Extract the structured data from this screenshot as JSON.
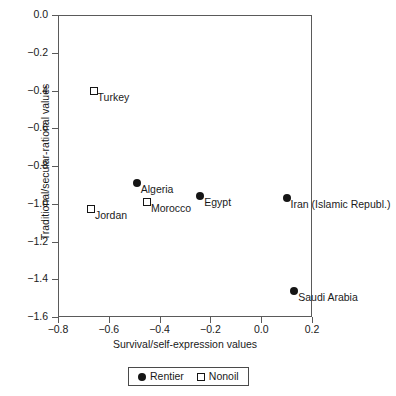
{
  "chart_data": {
    "type": "scatter",
    "title": "",
    "xlabel": "Survival/self-expression values",
    "ylabel": "Traditional/secular-rational values",
    "xlim": [
      -0.8,
      0.2
    ],
    "ylim": [
      -1.6,
      0.0
    ],
    "xticks": [
      "-0.8",
      "-0.6",
      "-0.4",
      "-0.2",
      "0.0",
      "0.2"
    ],
    "xtick_values": [
      -0.8,
      -0.6,
      -0.4,
      -0.2,
      0.0,
      0.2
    ],
    "yticks": [
      "0.0",
      "-0.2",
      "-0.4",
      "-0.6",
      "-0.8",
      "-1.0",
      "-1.2",
      "-1.4",
      "-1.6"
    ],
    "ytick_values": [
      0.0,
      -0.2,
      -0.4,
      -0.6,
      -0.8,
      -1.0,
      -1.2,
      -1.4,
      -1.6
    ],
    "grid": false,
    "legend_position": "bottom-center",
    "series": [
      {
        "name": "Rentier",
        "marker": "filled-circle",
        "color": "#151515",
        "points": [
          {
            "label": "Algeria",
            "x": -0.49,
            "y": -0.89,
            "label_pos": "right"
          },
          {
            "label": "Egypt",
            "x": -0.24,
            "y": -0.96,
            "label_pos": "right"
          },
          {
            "label": "Iran (Islamic Republ.)",
            "x": 0.1,
            "y": -0.97,
            "label_pos": "right"
          },
          {
            "label": "Saudi Arabia",
            "x": 0.13,
            "y": -1.46,
            "label_pos": "right"
          }
        ]
      },
      {
        "name": "Nonoil",
        "marker": "open-square",
        "color": "#151515",
        "points": [
          {
            "label": "Turkey",
            "x": -0.66,
            "y": -0.4,
            "label_pos": "right"
          },
          {
            "label": "Jordan",
            "x": -0.67,
            "y": -1.03,
            "label_pos": "right"
          },
          {
            "label": "Morocco",
            "x": -0.45,
            "y": -0.99,
            "label_pos": "right"
          }
        ]
      }
    ],
    "legend": [
      {
        "name": "Rentier",
        "marker": "filled-circle"
      },
      {
        "name": "Nonoil",
        "marker": "open-square"
      }
    ]
  }
}
